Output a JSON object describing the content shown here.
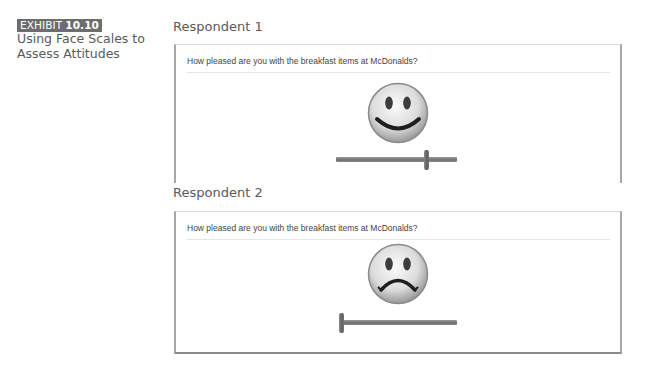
{
  "exhibit": {
    "label_word": "EXHIBIT",
    "label_number": "10.10",
    "title": "Using Face Scales to Assess Attitudes"
  },
  "respondents": [
    {
      "heading": "Respondent 1",
      "question": "How pleased are you with the breakfast items at McDonalds?",
      "face": "happy-face-icon",
      "slider_value_percent": 75
    },
    {
      "heading": "Respondent 2",
      "question": "How pleased are you with the breakfast items at McDonalds?",
      "face": "sad-face-icon",
      "slider_value_percent": 0
    }
  ],
  "colors": {
    "exhibit_label_bg": "#6d6d6d",
    "panel_border": "#a8a8a8",
    "slider": "#7a7a7a"
  }
}
